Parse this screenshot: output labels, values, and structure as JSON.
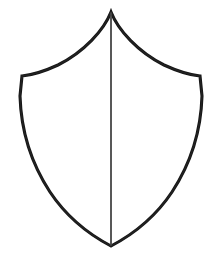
{
  "image": {
    "kind": "line-drawing",
    "subject": "heraldic-shield",
    "width": 221,
    "height": 263,
    "background_color": "#ffffff",
    "ink_color": "#151515",
    "divider_color": "#3a3a3a",
    "fill_color": "#ffffff",
    "style": "hand-drawn ink outline, no shading, no text",
    "title": "Shield outline with vertical per-pale division",
    "stroke_width_outline": 3.1,
    "stroke_width_divider": 1.9,
    "text_content": "none"
  },
  "geometry": {
    "apex": {
      "x": 111,
      "y": 12
    },
    "shoulder_left": {
      "x": 22,
      "y": 76
    },
    "shoulder_right": {
      "x": 200,
      "y": 76
    },
    "base_point": {
      "x": 111,
      "y": 246
    },
    "widest_left": {
      "x": 20,
      "y": 96
    },
    "widest_right": {
      "x": 202,
      "y": 96
    },
    "outline_path": "M111,12 C104,30 84,52 58,65 C45,71 32,75 22,76 L20,96 C21,130 31,163 50,192 C68,219 90,235 111,246 C132,235 154,219 172,192 C191,163 201,130 202,96 L200,76 C190,75 177,71 164,65 C138,52 118,30 111,12 Z",
    "divider_path": "M111,13 L111,245",
    "top_edge_curvature": "concave",
    "side_edge_curvature": "convex-then-tapering",
    "base_shape": "sharp-point",
    "symmetry": "bilateral about vertical axis x=111"
  },
  "elements": {
    "shield_outline_name": "shield-outline",
    "shield_field_name": "shield-field",
    "divider_name": "shield-pale-divider",
    "apex_name": "shield-apex",
    "base_name": "shield-base-point"
  },
  "labels": {
    "figure_caption": "",
    "annotations": []
  }
}
